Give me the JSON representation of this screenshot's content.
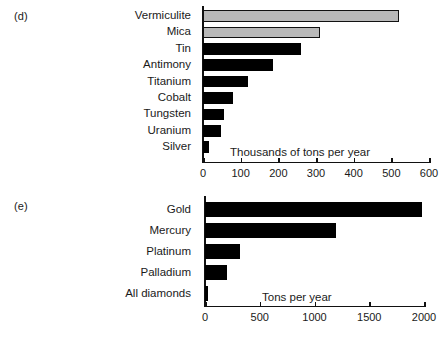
{
  "figure": {
    "panels": [
      {
        "tag": "(d)",
        "note": "Thousands of tons per year"
      },
      {
        "tag": "(e)",
        "note": "Tons per year"
      }
    ]
  },
  "chart_data": [
    {
      "type": "bar",
      "orientation": "horizontal",
      "panel": "(d)",
      "title": "",
      "xlabel": "Thousands of tons per year",
      "ylabel": "",
      "xlim": [
        0,
        600
      ],
      "xticks": [
        0,
        100,
        200,
        300,
        400,
        500,
        600
      ],
      "xtick_labels": [
        "0",
        "100",
        "200",
        "300",
        "400",
        "500",
        "600"
      ],
      "grid": false,
      "legend": "none",
      "categories": [
        "Vermiculite",
        "Mica",
        "Tin",
        "Antimony",
        "Titanium",
        "Cobalt",
        "Tungsten",
        "Uranium",
        "Silver"
      ],
      "values": [
        520,
        310,
        260,
        185,
        120,
        80,
        56,
        48,
        15
      ],
      "bar_colors": [
        "#b9b9b9",
        "#b9b9b9",
        "#000000",
        "#000000",
        "#000000",
        "#000000",
        "#000000",
        "#000000",
        "#000000"
      ]
    },
    {
      "type": "bar",
      "orientation": "horizontal",
      "panel": "(e)",
      "title": "",
      "xlabel": "Tons per year",
      "ylabel": "",
      "xlim": [
        0,
        2000
      ],
      "xticks": [
        0,
        500,
        1000,
        1500,
        2000
      ],
      "xtick_labels": [
        "0",
        "500",
        "1000",
        "1500",
        "2000"
      ],
      "grid": false,
      "legend": "none",
      "categories": [
        "Gold",
        "Mercury",
        "Platinum",
        "Palladium",
        "All diamonds"
      ],
      "values": [
        1980,
        1200,
        320,
        200,
        25
      ],
      "bar_colors": [
        "#000000",
        "#000000",
        "#000000",
        "#000000",
        "#000000"
      ]
    }
  ]
}
